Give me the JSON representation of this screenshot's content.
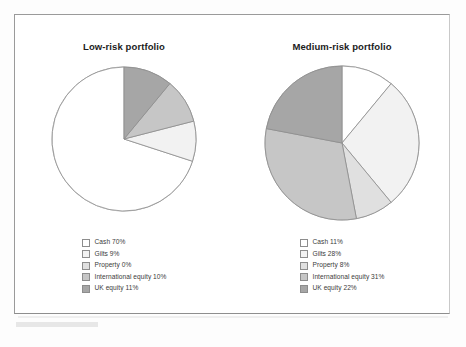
{
  "figure": {
    "background_color": "#ffffff",
    "frame_color": "#9a9a9a"
  },
  "palette": {
    "cash": "#ffffff",
    "gilts": "#f2f2f2",
    "property": "#e0e0e0",
    "international_equity": "#c6c6c6",
    "uk_equity": "#a6a6a6",
    "outline": "#8d8d8d"
  },
  "charts": [
    {
      "id": "low-risk",
      "title": "Low-risk portfolio",
      "legend": [
        {
          "label": "Cash 70%",
          "color": "#ffffff"
        },
        {
          "label": "Gilts 9%",
          "color": "#f2f2f2"
        },
        {
          "label": "Property 0%",
          "color": "#e0e0e0"
        },
        {
          "label": "International equity 10%",
          "color": "#c6c6c6"
        },
        {
          "label": "UK equity 11%",
          "color": "#a6a6a6"
        }
      ]
    },
    {
      "id": "medium-risk",
      "title": "Medium-risk portfolio",
      "legend": [
        {
          "label": "Cash 11%",
          "color": "#ffffff"
        },
        {
          "label": "Gilts 28%",
          "color": "#f2f2f2"
        },
        {
          "label": "Property 8%",
          "color": "#e0e0e0"
        },
        {
          "label": "International equity 31%",
          "color": "#c6c6c6"
        },
        {
          "label": "UK equity 22%",
          "color": "#a6a6a6"
        }
      ]
    }
  ],
  "chart_data": [
    {
      "type": "pie",
      "title": "Low-risk portfolio",
      "categories": [
        "Cash",
        "Gilts",
        "Property",
        "International equity",
        "UK equity"
      ],
      "values": [
        70,
        9,
        0,
        10,
        11
      ],
      "unit": "%",
      "colors": [
        "#ffffff",
        "#f2f2f2",
        "#e0e0e0",
        "#c6c6c6",
        "#a6a6a6"
      ],
      "start_angle_deg": 0,
      "direction": "counterclockwise",
      "legend": "below",
      "labels": [
        "Cash 70%",
        "Gilts 9%",
        "Property 0%",
        "International equity 10%",
        "UK equity 11%"
      ]
    },
    {
      "type": "pie",
      "title": "Medium-risk portfolio",
      "categories": [
        "Cash",
        "Gilts",
        "Property",
        "International equity",
        "UK equity"
      ],
      "values": [
        11,
        28,
        8,
        31,
        22
      ],
      "unit": "%",
      "colors": [
        "#ffffff",
        "#f2f2f2",
        "#e0e0e0",
        "#c6c6c6",
        "#a6a6a6"
      ],
      "start_angle_deg": 0,
      "direction": "clockwise",
      "legend": "below",
      "labels": [
        "Cash 11%",
        "Gilts 28%",
        "Property 8%",
        "International equity 31%",
        "UK equity 22%"
      ]
    }
  ]
}
